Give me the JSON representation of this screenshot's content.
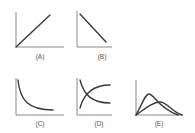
{
  "figure": {
    "panels": [
      {
        "id": "A",
        "label": "(A)",
        "shape": "straight line increasing (direct proportion)"
      },
      {
        "id": "B",
        "label": "(B)",
        "shape": "straight line decreasing"
      },
      {
        "id": "C",
        "label": "(C)",
        "shape": "decreasing hyperbolic curve (inverse proportion)"
      },
      {
        "id": "D",
        "label": "(D)",
        "shape": "two crossing curves: one decreasing, one increasing"
      },
      {
        "id": "E",
        "label": "(E)",
        "shape": "two skewed peaked distribution curves"
      }
    ]
  },
  "colors": {
    "axis": "#8a8a8a",
    "curve": "#3a3a3a",
    "background": "#ffffff"
  }
}
